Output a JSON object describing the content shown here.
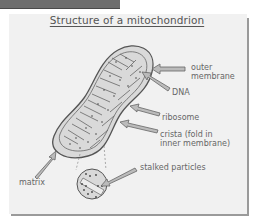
{
  "title": "Structure of a mitochondrion",
  "labels": {
    "outer_membrane_line1": "outer",
    "outer_membrane_line2": "membrane",
    "dna": "DNA",
    "ribosome": "ribosome",
    "crista_line1": "crista (fold in",
    "crista_line2": "inner membrane)",
    "matrix": "matrix",
    "stalked_particles": "stalked particles"
  },
  "colors": {
    "panel_bg": "#f1f1f1",
    "organelle_fill": "#d9d9d9",
    "outline": "#666666",
    "text": "#666666"
  }
}
